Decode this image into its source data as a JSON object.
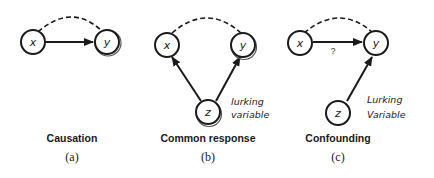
{
  "panels": [
    {
      "id": "a",
      "caption": "Causation",
      "sublabel": "(a)",
      "nodes": {
        "x": "x",
        "y": "y"
      }
    },
    {
      "id": "b",
      "caption": "Common response",
      "sublabel": "(b)",
      "nodes": {
        "x": "x",
        "y": "y",
        "z": "z"
      },
      "annotation": [
        "lurking",
        "variable"
      ]
    },
    {
      "id": "c",
      "caption": "Confounding",
      "sublabel": "(c)",
      "nodes": {
        "x": "x",
        "y": "y",
        "z": "z"
      },
      "edge_label": "?",
      "annotation": [
        "Lurking",
        "Variable"
      ]
    }
  ]
}
